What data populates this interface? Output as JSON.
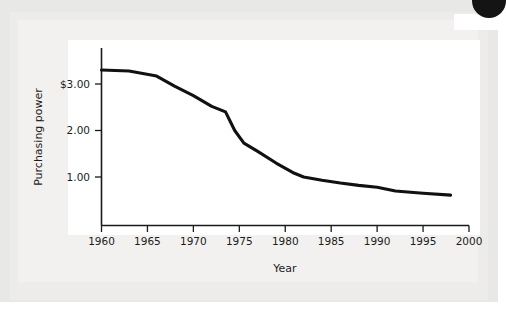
{
  "figure": {
    "background_color": "#edecea",
    "panel_color": "#ffffff",
    "line_color": "#111111"
  },
  "chart_data": {
    "type": "line",
    "title": "",
    "subtitle": "",
    "xlabel": "Year",
    "ylabel": "Purchasing power",
    "xlim": [
      1960,
      2000
    ],
    "ylim": [
      0,
      3.6
    ],
    "grid": false,
    "legend": "none",
    "xticks": [
      1960,
      1965,
      1970,
      1975,
      1980,
      1985,
      1990,
      1995,
      2000
    ],
    "xtick_labels": [
      "1960",
      "1965",
      "1970",
      "1975",
      "1980",
      "1985",
      "1990",
      "1995",
      "2000"
    ],
    "yticks": [
      1.0,
      2.0,
      3.0
    ],
    "ytick_labels": [
      "1.00",
      "2.00",
      "$3.00"
    ],
    "series": [
      {
        "name": "Purchasing power",
        "x": [
          1960,
          1963,
          1966,
          1968,
          1970,
          1972,
          1973.5,
          1974.5,
          1975.5,
          1977,
          1979,
          1981,
          1982,
          1984,
          1986,
          1988,
          1990,
          1992,
          1995,
          1998
        ],
        "values": [
          3.3,
          3.28,
          3.17,
          2.95,
          2.75,
          2.52,
          2.4,
          2.0,
          1.73,
          1.55,
          1.3,
          1.08,
          1.0,
          0.93,
          0.87,
          0.82,
          0.78,
          0.7,
          0.65,
          0.61
        ]
      }
    ]
  }
}
